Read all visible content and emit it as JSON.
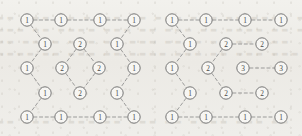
{
  "figure": {
    "background_color": "#efeeea",
    "node_fill": "#f7f6f3",
    "node_stroke": "#6f6f6f",
    "edge_color": "#8c8c8c",
    "label_color": "#4a4a4a",
    "node_radius": 6.2,
    "width": 302,
    "height": 136
  },
  "background_text": {
    "description": "faint bleed-through text from reverse side of page",
    "lines": [
      "▬▬ ▬▬▬ ▬▬ ▬▬▬▬ ▬▬ ▬▬▬ ▬▬▬ ▬▬ ▬▬▬▬ ▬▬▬ ▬▬",
      "▬▬▬ ▬▬ ▬▬▬▬ ▬▬▬ ▬▬ ▬▬▬ ▬▬ ▬▬▬▬ ▬▬ ▬▬▬",
      "▬▬ ▬▬▬▬ ▬▬▬ ▬▬ ▬▬▬ ▬▬▬▬ ▬▬ ▬▬▬ ▬▬",
      "▬▬▬▬ ▬▬ ▬▬▬ ▬▬ ▬▬▬▬ ▬▬▬ ▬▬ ▬▬▬ ▬▬▬",
      "▬▬ ▬▬▬ ▬▬▬▬ ▬▬ ▬▬▬ ▬▬ ▬▬▬▬ ▬▬▬ ▬▬"
    ],
    "tops": [
      14,
      26,
      38,
      50,
      118
    ]
  },
  "diagrams": [
    {
      "id": "left-lattice",
      "name": "left-lattice-diagram",
      "nodes": [
        {
          "id": "L-t1",
          "label": "1",
          "x": 27,
          "y": 20
        },
        {
          "id": "L-t2",
          "label": "1",
          "x": 61,
          "y": 20
        },
        {
          "id": "L-t3",
          "label": "1",
          "x": 100,
          "y": 20
        },
        {
          "id": "L-t4",
          "label": "1",
          "x": 134,
          "y": 20
        },
        {
          "id": "L-lz1",
          "label": "1",
          "x": 45,
          "y": 44
        },
        {
          "id": "L-lz2",
          "label": "1",
          "x": 27,
          "y": 68
        },
        {
          "id": "L-lz3",
          "label": "1",
          "x": 45,
          "y": 93
        },
        {
          "id": "L-rz1",
          "label": "1",
          "x": 117,
          "y": 44
        },
        {
          "id": "L-rz2",
          "label": "1",
          "x": 134,
          "y": 68
        },
        {
          "id": "L-rz3",
          "label": "1",
          "x": 117,
          "y": 93
        },
        {
          "id": "L-dT",
          "label": "2",
          "x": 80,
          "y": 44
        },
        {
          "id": "L-dL",
          "label": "2",
          "x": 62,
          "y": 68
        },
        {
          "id": "L-dR",
          "label": "2",
          "x": 99,
          "y": 68
        },
        {
          "id": "L-dB",
          "label": "2",
          "x": 80,
          "y": 93
        },
        {
          "id": "L-b1",
          "label": "1",
          "x": 27,
          "y": 117
        },
        {
          "id": "L-b2",
          "label": "1",
          "x": 61,
          "y": 117
        },
        {
          "id": "L-b3",
          "label": "1",
          "x": 100,
          "y": 117
        },
        {
          "id": "L-b4",
          "label": "1",
          "x": 134,
          "y": 117
        }
      ],
      "edges": [
        [
          "L-t1",
          "L-t2"
        ],
        [
          "L-t2",
          "L-t3"
        ],
        [
          "L-t3",
          "L-t4"
        ],
        [
          "L-t1",
          "L-lz1"
        ],
        [
          "L-lz1",
          "L-lz2"
        ],
        [
          "L-lz2",
          "L-lz3"
        ],
        [
          "L-lz3",
          "L-b1"
        ],
        [
          "L-t4",
          "L-rz1"
        ],
        [
          "L-rz1",
          "L-rz2"
        ],
        [
          "L-rz2",
          "L-rz3"
        ],
        [
          "L-rz3",
          "L-b4"
        ],
        [
          "L-dT",
          "L-dL"
        ],
        [
          "L-dT",
          "L-dR"
        ],
        [
          "L-dL",
          "L-dB"
        ],
        [
          "L-dR",
          "L-dB"
        ],
        [
          "L-b1",
          "L-b2"
        ],
        [
          "L-b2",
          "L-b3"
        ],
        [
          "L-b3",
          "L-b4"
        ]
      ]
    },
    {
      "id": "right-lattice",
      "name": "right-lattice-diagram",
      "nodes": [
        {
          "id": "R-t1",
          "label": "1",
          "x": 172,
          "y": 20
        },
        {
          "id": "R-t2",
          "label": "1",
          "x": 206,
          "y": 20
        },
        {
          "id": "R-t3",
          "label": "1",
          "x": 245,
          "y": 20
        },
        {
          "id": "R-t4",
          "label": "1",
          "x": 281,
          "y": 20
        },
        {
          "id": "R-lz1",
          "label": "1",
          "x": 190,
          "y": 44
        },
        {
          "id": "R-lz2",
          "label": "1",
          "x": 172,
          "y": 68
        },
        {
          "id": "R-lz3",
          "label": "1",
          "x": 190,
          "y": 93
        },
        {
          "id": "R-m2a",
          "label": "2",
          "x": 226,
          "y": 44
        },
        {
          "id": "R-m2b",
          "label": "2",
          "x": 262,
          "y": 44
        },
        {
          "id": "R-mL",
          "label": "2",
          "x": 208,
          "y": 68
        },
        {
          "id": "R-m3a",
          "label": "3",
          "x": 243,
          "y": 68
        },
        {
          "id": "R-m3b",
          "label": "3",
          "x": 281,
          "y": 68
        },
        {
          "id": "R-m2c",
          "label": "2",
          "x": 226,
          "y": 93
        },
        {
          "id": "R-m2d",
          "label": "2",
          "x": 262,
          "y": 93
        },
        {
          "id": "R-b1",
          "label": "1",
          "x": 172,
          "y": 117
        },
        {
          "id": "R-b2",
          "label": "1",
          "x": 206,
          "y": 117
        },
        {
          "id": "R-b3",
          "label": "1",
          "x": 245,
          "y": 117
        },
        {
          "id": "R-b4",
          "label": "1",
          "x": 281,
          "y": 117
        }
      ],
      "edges": [
        [
          "R-t1",
          "R-t2"
        ],
        [
          "R-t2",
          "R-t3"
        ],
        [
          "R-t3",
          "R-t4"
        ],
        [
          "R-t1",
          "R-lz1"
        ],
        [
          "R-lz1",
          "R-lz2"
        ],
        [
          "R-lz2",
          "R-lz3"
        ],
        [
          "R-lz3",
          "R-b1"
        ],
        [
          "R-m2a",
          "R-m2b"
        ],
        [
          "R-m2a",
          "R-mL"
        ],
        [
          "R-mL",
          "R-m2c"
        ],
        [
          "R-m3a",
          "R-m3b"
        ],
        [
          "R-m2c",
          "R-m2d"
        ],
        [
          "R-b1",
          "R-b2"
        ],
        [
          "R-b2",
          "R-b3"
        ],
        [
          "R-b3",
          "R-b4"
        ]
      ]
    }
  ]
}
